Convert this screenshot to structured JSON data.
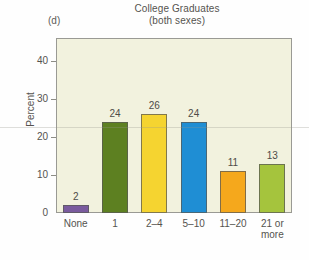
{
  "figure": {
    "panel_label": "(d)",
    "title_line1": "College Graduates",
    "title_line2": "(both sexes)",
    "plot_background": "#f2f2de",
    "frame_color": "#9a9a94"
  },
  "chart_data": {
    "type": "bar",
    "title": "College Graduates (both sexes)",
    "panel": "(d)",
    "xlabel": "",
    "ylabel": "Percent",
    "categories": [
      "None",
      "1",
      "2–4",
      "5–10",
      "11–20",
      "21 or more"
    ],
    "values": [
      2,
      24,
      26,
      24,
      11,
      13
    ],
    "value_labels": [
      "2",
      "24",
      "26",
      "24",
      "11",
      "13"
    ],
    "bar_colors": [
      "#7a5b9e",
      "#5d8021",
      "#f5d430",
      "#1f8ed4",
      "#f5a81c",
      "#a5c43d"
    ],
    "ylim": [
      0,
      46
    ],
    "yticks": [
      0,
      10,
      20,
      30,
      40
    ],
    "ytick_labels": [
      "0",
      "10",
      "20",
      "30",
      "40"
    ],
    "grid": false,
    "legend": "none"
  }
}
